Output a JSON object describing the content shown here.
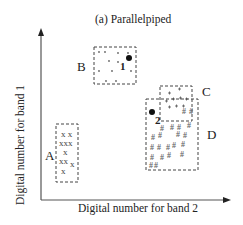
{
  "title": "(a) Parallelpiped",
  "x_axis_label": "Digital number for band 2",
  "y_axis_label": "Digital number for band 1",
  "classes": [
    {
      "id": "A",
      "label": "A",
      "symbol": "x"
    },
    {
      "id": "B",
      "label": "B",
      "symbol": "•"
    },
    {
      "id": "C",
      "label": "C",
      "symbol": "+"
    },
    {
      "id": "D",
      "label": "D",
      "symbol": "#"
    }
  ],
  "unknown_points": [
    {
      "id": "1",
      "label": "1"
    },
    {
      "id": "2",
      "label": "2"
    }
  ],
  "colors": {
    "axis": "#555555",
    "text": "#222222",
    "box": "#444444"
  }
}
